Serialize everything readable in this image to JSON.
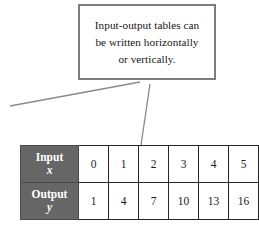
{
  "figure": {
    "background_color": "#ffffff",
    "callout": {
      "border_color": "#7d7d7d",
      "lines": [
        "Input-output tables can",
        "be written horizontally",
        "or vertically."
      ]
    },
    "leader_lines": {
      "stroke_color": "#8a8a8a",
      "count": 2
    },
    "table": {
      "header_background": "#666666",
      "header_text_color": "#ffffff",
      "border_color": "#262626",
      "rows": [
        {
          "header_word": "Input",
          "header_variable": "x",
          "values": [
            "0",
            "1",
            "2",
            "3",
            "4",
            "5"
          ]
        },
        {
          "header_word": "Output",
          "header_variable": "y",
          "values": [
            "1",
            "4",
            "7",
            "10",
            "13",
            "16"
          ]
        }
      ]
    }
  }
}
